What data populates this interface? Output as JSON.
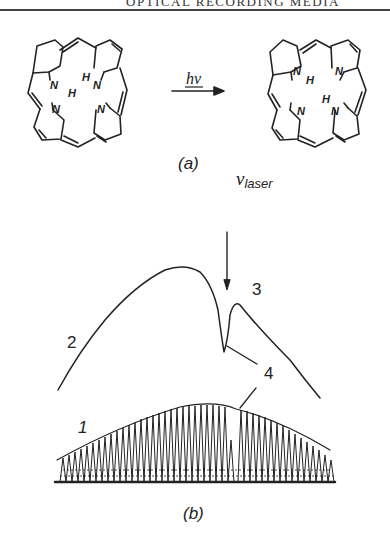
{
  "page": {
    "running_header": "OPTICAL RECORDING MEDIA"
  },
  "figure": {
    "part_a": {
      "caption": "(a)",
      "reaction_label_top": "hν",
      "reaction_label_bottom": "~",
      "left_molecule": {
        "atoms": [
          "N",
          "H",
          "H",
          "N",
          "N",
          "N"
        ]
      },
      "right_molecule": {
        "atoms": [
          "N",
          "H",
          "N",
          "H",
          "N",
          "N"
        ]
      }
    },
    "part_b": {
      "caption": "(b)",
      "laser_symbol": "ν",
      "laser_subscript": "laser",
      "curve_labels": [
        "1",
        "2",
        "3",
        "4"
      ]
    }
  }
}
